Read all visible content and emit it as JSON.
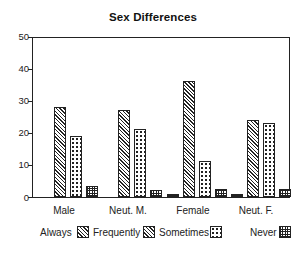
{
  "chart_data": {
    "type": "bar",
    "title": "Sex Differences",
    "xlabel": "",
    "ylabel": "",
    "ylim": [
      0,
      50
    ],
    "yticks": [
      0,
      10,
      20,
      30,
      40,
      50
    ],
    "grid": false,
    "legend_position": "bottom",
    "categories": [
      "Male",
      "Neut. M.",
      "Female",
      "Neut. F."
    ],
    "series": [
      {
        "name": "Always",
        "pattern": "brick",
        "values": [
          0,
          0,
          1,
          1
        ]
      },
      {
        "name": "Frequently",
        "pattern": "diagonal-hatch",
        "values": [
          28.3,
          27.3,
          36.6,
          24.2
        ]
      },
      {
        "name": "Sometimes",
        "pattern": "dots",
        "values": [
          19.3,
          21.3,
          11.2,
          23.3
        ]
      },
      {
        "name": "Never",
        "pattern": "grid",
        "values": [
          3.4,
          2.2,
          2.5,
          2.4
        ]
      }
    ]
  },
  "title": "Sex Differences",
  "yaxis": {
    "ticks": [
      "50",
      "40",
      "30",
      "20",
      "10",
      "0"
    ]
  },
  "xaxis": {
    "labels": [
      "Male",
      "Neut. M.",
      "Female",
      "Neut. F."
    ]
  },
  "legend": {
    "items": [
      {
        "label": "Always",
        "pattern": "frequently-swatch"
      },
      {
        "label": "Frequently",
        "pattern": "frequently-swatch"
      },
      {
        "label": "Sometimes",
        "pattern": "sometimes-swatch"
      },
      {
        "label": "Never",
        "pattern": "never-swatch"
      }
    ]
  },
  "colors": {
    "ink": "#222222",
    "background": "#ffffff"
  }
}
